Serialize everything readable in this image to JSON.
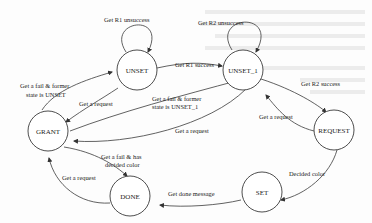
{
  "diagram": {
    "type": "state-machine",
    "states": [
      {
        "id": "UNSET",
        "label": "UNSET"
      },
      {
        "id": "UNSET_1",
        "label": "UNSET_1"
      },
      {
        "id": "GRANT",
        "label": "GRANT"
      },
      {
        "id": "REQUEST",
        "label": "REQUEST"
      },
      {
        "id": "SET",
        "label": "SET"
      },
      {
        "id": "DONE",
        "label": "DONE"
      }
    ],
    "transitions": [
      {
        "from": "UNSET",
        "to": "UNSET",
        "label": "Get R1 unsuccess"
      },
      {
        "from": "UNSET_1",
        "to": "UNSET_1",
        "label": "Get R2 unsuccess"
      },
      {
        "from": "UNSET",
        "to": "UNSET_1",
        "label": "Get R1 success"
      },
      {
        "from": "UNSET_1",
        "to": "REQUEST",
        "label": "Get R2 success"
      },
      {
        "from": "REQUEST",
        "to": "UNSET_1",
        "label": "Get a request"
      },
      {
        "from": "REQUEST",
        "to": "SET",
        "label": "Decided color"
      },
      {
        "from": "SET",
        "to": "DONE",
        "label": "Get done message"
      },
      {
        "from": "DONE",
        "to": "GRANT",
        "label": "Get a request"
      },
      {
        "from": "GRANT",
        "to": "DONE",
        "label_line1": "Get a fail & has",
        "label_line2": "decided color"
      },
      {
        "from": "GRANT",
        "to": "UNSET",
        "label_line1": "Get a fail & former",
        "label_line2": "state is UNSET"
      },
      {
        "from": "UNSET",
        "to": "GRANT",
        "label": "Get a request"
      },
      {
        "from": "GRANT",
        "to": "UNSET_1",
        "label_line1": "Get a fail & former",
        "label_line2": "state is UNSET_1"
      },
      {
        "from": "UNSET_1",
        "to": "GRANT",
        "label": "Get a request"
      }
    ]
  },
  "labels": {
    "unset_self": "Get R1 unsuccess",
    "unset1_self": "Get R2 unsuccess",
    "r1_success": "Get R1 success",
    "r2_success": "Get R2 success",
    "request_to_unset1": "Get a request",
    "decided_color": "Decided color",
    "done_message": "Get done message",
    "done_to_grant": "Get a request",
    "grant_done_1": "Get a fail & has",
    "grant_done_2": "decided color",
    "grant_unset_1": "Get a fail & former",
    "grant_unset_2": "state is UNSET",
    "unset_to_grant": "Get a request",
    "grant_unset1_1": "Get a fail & former",
    "grant_unset1_2": "state is UNSET_1",
    "unset1_to_grant": "Get a request"
  }
}
